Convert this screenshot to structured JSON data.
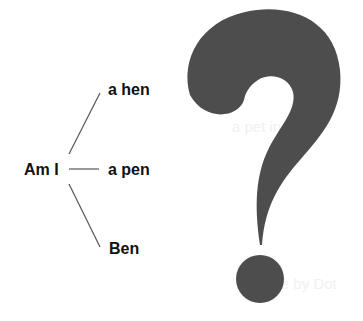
{
  "diagram": {
    "root": "Am I",
    "branches": [
      {
        "label": "a hen"
      },
      {
        "label": "a pen"
      },
      {
        "label": "Ben"
      }
    ]
  },
  "symbol": {
    "name": "question-mark",
    "color": "#4d4d4d"
  },
  "colors": {
    "text": "#111111",
    "lines": "#555555",
    "background": "#ffffff"
  },
  "background_showthrough": [
    "for a pat",
    "a pet in a rug",
    "cuddle by Dot"
  ]
}
